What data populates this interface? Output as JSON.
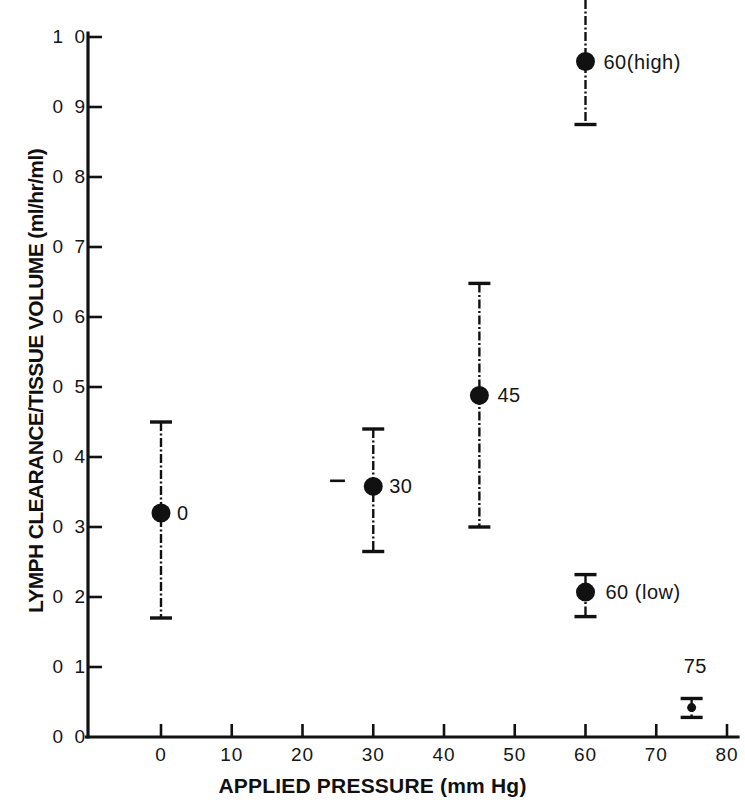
{
  "chart_data": {
    "type": "scatter",
    "title": "",
    "xlabel": "APPLIED PRESSURE (mm Hg)",
    "ylabel": "LYMPH CLEARANCE/TISSUE VOLUME (ml/hr/ml)",
    "xlim": [
      -3,
      82
    ],
    "ylim": [
      0.0,
      1.05
    ],
    "xticks": [
      0,
      10,
      20,
      30,
      40,
      50,
      60,
      70,
      80
    ],
    "xtick_labels": [
      "0",
      "10",
      "20",
      "30",
      "40",
      "50",
      "60",
      "70",
      "80"
    ],
    "yticks": [
      0.0,
      0.1,
      0.2,
      0.3,
      0.4,
      0.5,
      0.6,
      0.7,
      0.8,
      0.9,
      1.0
    ],
    "ytick_labels": [
      "0 0",
      "0 1",
      "0 2",
      "0 3",
      "0 4",
      "0 5",
      "0 6",
      "0 7",
      "0 8",
      "0 9",
      "1 0"
    ],
    "grid": false,
    "legend": "none",
    "marker": "filled-circle",
    "marker_color": "#111111",
    "errorbar_style": "dash-dot-line-with-caps",
    "points": [
      {
        "label": "0",
        "x": 0,
        "y": 0.32,
        "err_low": 0.17,
        "err_high": 0.45,
        "label_dx": 16,
        "label_dy": 0,
        "clipped_top": false
      },
      {
        "label": "30",
        "x": 30,
        "y": 0.358,
        "err_low": 0.265,
        "err_high": 0.44,
        "label_dx": 16,
        "label_dy": 0,
        "clipped_top": false
      },
      {
        "label": "45",
        "x": 45,
        "y": 0.488,
        "err_low": 0.3,
        "err_high": 0.648,
        "label_dx": 18,
        "label_dy": 0,
        "clipped_top": false
      },
      {
        "label": "60(high)",
        "x": 60,
        "y": 0.965,
        "err_low": 0.875,
        "err_high": 1.06,
        "label_dx": 18,
        "label_dy": 0,
        "clipped_top": true
      },
      {
        "label": "60 (low)",
        "x": 60,
        "y": 0.207,
        "err_low": 0.172,
        "err_high": 0.232,
        "label_dx": 20,
        "label_dy": 0,
        "clipped_top": false
      },
      {
        "label": "75",
        "x": 75,
        "y": 0.042,
        "err_low": 0.028,
        "err_high": 0.055,
        "label_dx": -8,
        "label_dy": -42,
        "clipped_top": false
      }
    ],
    "stray_marks": [
      {
        "name": "stray-dash-near-30",
        "x1": 23.9,
        "x2": 26.0,
        "y": 0.366
      }
    ]
  }
}
